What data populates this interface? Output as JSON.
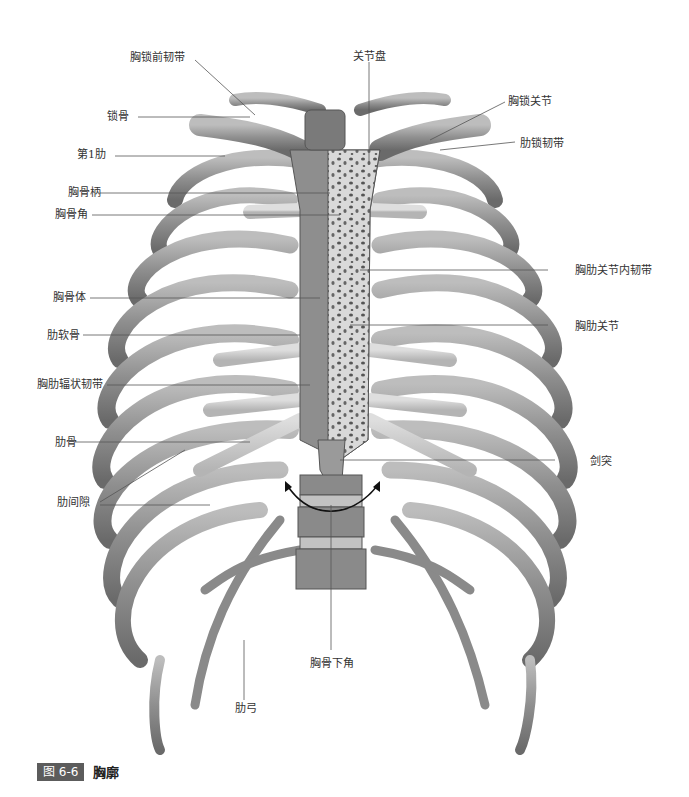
{
  "figure": {
    "number": "图 6-6",
    "title": "胸廓"
  },
  "labels": {
    "sternoclavicular_anterior_ligament": "胸锁前韧带",
    "articular_disc": "关节盘",
    "sternoclavicular_joint": "胸锁关节",
    "clavicle": "锁骨",
    "costoclavicular_ligament": "肋锁韧带",
    "first_rib": "第1肋",
    "manubrium": "胸骨柄",
    "sternal_angle": "胸骨角",
    "intraarticular_sternocostal_ligament": "胸肋关节内韧带",
    "sternal_body": "胸骨体",
    "sternocostal_joint": "胸肋关节",
    "costal_cartilage": "肋软骨",
    "radiate_sternocostal_ligament": "胸肋辐状韧带",
    "rib": "肋骨",
    "xiphoid_process": "剑突",
    "intercostal_space": "肋间隙",
    "infrasternal_angle": "胸骨下角",
    "costal_arch": "肋弓"
  },
  "colors": {
    "bone": "#9a9a9a",
    "bone_dark": "#6e6e6e",
    "cartilage": "#c9c9c9",
    "cancellous": "#d8d8d8",
    "leader_line": "#555555",
    "caption_box": "#5c5c5c"
  }
}
